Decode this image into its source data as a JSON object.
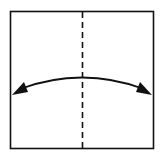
{
  "diagram": {
    "type": "origami-fold-step",
    "colors": {
      "background": "#ffffff",
      "stroke": "#111111"
    },
    "paper_square": {
      "x": 10,
      "y": 11,
      "width": 144,
      "height": 138
    },
    "fold_line": {
      "style": "dashed",
      "x": 82,
      "y1": 11,
      "y2": 149
    },
    "arrow": {
      "style": "double-headed-curved",
      "from": [
        13,
        93
      ],
      "to": [
        151,
        93
      ],
      "apex_y": 77
    }
  }
}
